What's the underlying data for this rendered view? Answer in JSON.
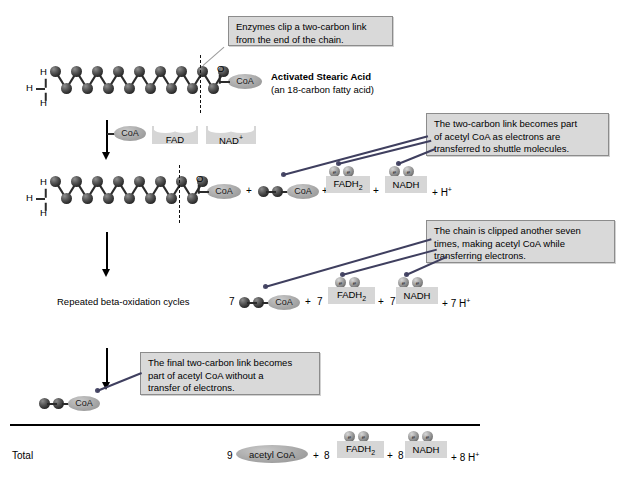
{
  "figure": {
    "title_label": "Activated Stearic Acid",
    "subtitle_label": "(an 18-carbon fatty acid)",
    "repeated_cycles_label": "Repeated beta-oxidation cycles",
    "total_label": "Total"
  },
  "callouts": [
    {
      "id": "callout-enzymes-clip",
      "lines": [
        "Enzymes clip a two-carbon link",
        "from the end of the chain."
      ]
    },
    {
      "id": "callout-two-carbon-link",
      "lines": [
        "The two-carbon link becomes part",
        "of acetyl CoA as electrons are",
        "transferred to shuttle molecules."
      ]
    },
    {
      "id": "callout-clipped-seven",
      "lines": [
        "The chain is clipped another seven",
        "times, making acetyl CoA while",
        "transferring electrons."
      ]
    },
    {
      "id": "callout-final-link",
      "lines": [
        "The final two-carbon link becomes",
        "part of acetyl CoA without a",
        "transfer of electrons."
      ]
    }
  ],
  "molecules": {
    "coa_label": "CoA",
    "acetyl_coa_label": "acetyl CoA",
    "fad_label": "FAD",
    "nad_label": "NAD",
    "nad_superscript": "+",
    "fadh2_label": "FADH",
    "fadh2_subscript": "2",
    "nadh_label": "NADH",
    "oxygen_label": "O",
    "hydrogen_label": "H",
    "proton_label": "H",
    "proton_superscript": "+",
    "electron_label": "e"
  },
  "reactions": {
    "row1": {
      "chain_carbons_top": 9,
      "chain_carbons_bottom": 8,
      "hydrogens": [
        "H",
        "H",
        "H"
      ]
    },
    "row2": {
      "chain_carbons_top": 8,
      "chain_carbons_bottom": 7,
      "plus1": "+",
      "plus2": "+",
      "plus3": "+",
      "plus4": "+",
      "proton": "H"
    },
    "row3": {
      "coefficient_acetyl": "7",
      "coefficient_fadh2": "7",
      "coefficient_nadh": "7",
      "coefficient_proton": "7",
      "plus1": "+",
      "plus2": "+",
      "plus3": "+"
    },
    "total_row": {
      "coefficient_acetyl": "9",
      "coefficient_fadh2": "8",
      "coefficient_nadh": "8",
      "coefficient_proton": "8",
      "plus1": "+",
      "plus2": "+",
      "plus3": "+"
    }
  },
  "colors": {
    "callout_fill": "#d9d9d9",
    "callout_border": "#8c8c8c",
    "shuttle_fill": "#d6d6d6",
    "coa_fill": "#a8a8a8",
    "carbon_fill": "#2a2a2a",
    "leader_line": "#4a4a68",
    "page_background": "#ffffff"
  }
}
